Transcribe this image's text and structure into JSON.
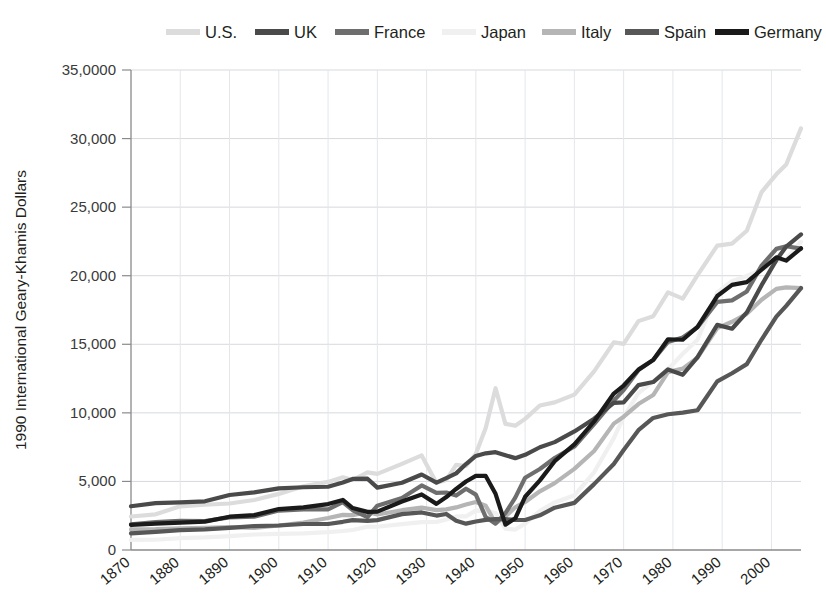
{
  "chart_data": {
    "type": "line",
    "title": "",
    "xlabel": "",
    "ylabel": "1990 International Geary-Khamis Dollars",
    "xlim": [
      1870,
      2006
    ],
    "ylim": [
      0,
      35000
    ],
    "grid": true,
    "legend_position": "top",
    "y_ticks": [
      {
        "value": 35000,
        "label": "35,0000"
      },
      {
        "value": 30000,
        "label": "30,000"
      },
      {
        "value": 25000,
        "label": "25,000"
      },
      {
        "value": 20000,
        "label": "20,000"
      },
      {
        "value": 15000,
        "label": "15,000"
      },
      {
        "value": 10000,
        "label": "10,000"
      },
      {
        "value": 5000,
        "label": "5,000"
      },
      {
        "value": 0,
        "label": "0"
      }
    ],
    "x_ticks": [
      {
        "value": 1870,
        "label": "1870"
      },
      {
        "value": 1880,
        "label": "1880"
      },
      {
        "value": 1890,
        "label": "1890"
      },
      {
        "value": 1900,
        "label": "1900"
      },
      {
        "value": 1910,
        "label": "1910"
      },
      {
        "value": 1920,
        "label": "1920"
      },
      {
        "value": 1930,
        "label": "1930"
      },
      {
        "value": 1940,
        "label": "1940"
      },
      {
        "value": 1950,
        "label": "1950"
      },
      {
        "value": 1960,
        "label": "1960"
      },
      {
        "value": 1970,
        "label": "1970"
      },
      {
        "value": 1980,
        "label": "1980"
      },
      {
        "value": 1990,
        "label": "1990"
      },
      {
        "value": 2000,
        "label": "2000"
      }
    ],
    "series": [
      {
        "name": "U.S.",
        "color": "#dcdcdc",
        "width": 4.2,
        "x": [
          1870,
          1875,
          1880,
          1885,
          1890,
          1895,
          1900,
          1905,
          1910,
          1913,
          1915,
          1918,
          1920,
          1925,
          1929,
          1930,
          1932,
          1934,
          1936,
          1938,
          1940,
          1942,
          1944,
          1946,
          1948,
          1950,
          1953,
          1956,
          1960,
          1964,
          1968,
          1970,
          1973,
          1976,
          1979,
          1982,
          1985,
          1989,
          1992,
          1995,
          1998,
          2001,
          2003,
          2006
        ],
        "values": [
          2445,
          2600,
          3184,
          3300,
          3392,
          3644,
          4091,
          4642,
          4964,
          5301,
          5100,
          5659,
          5552,
          6282,
          6899,
          6213,
          4908,
          5114,
          6204,
          6126,
          7010,
          8899,
          11799,
          9197,
          9065,
          9561,
          10540,
          10761,
          11328,
          13026,
          15140,
          15030,
          16689,
          17045,
          18789,
          18325,
          20039,
          22197,
          22345,
          23277,
          26096,
          27395,
          28113,
          30746
        ]
      },
      {
        "name": "UK",
        "color": "#4a4a4a",
        "width": 4.2,
        "x": [
          1870,
          1875,
          1880,
          1885,
          1890,
          1895,
          1900,
          1905,
          1910,
          1913,
          1915,
          1918,
          1920,
          1925,
          1929,
          1932,
          1934,
          1936,
          1938,
          1940,
          1942,
          1944,
          1946,
          1948,
          1950,
          1953,
          1956,
          1960,
          1964,
          1968,
          1970,
          1973,
          1976,
          1979,
          1982,
          1985,
          1989,
          1992,
          1995,
          1998,
          2001,
          2003,
          2006
        ],
        "values": [
          3190,
          3415,
          3477,
          3549,
          4009,
          4197,
          4492,
          4577,
          4611,
          4921,
          5184,
          5200,
          4548,
          4905,
          5503,
          4908,
          5247,
          5586,
          6266,
          6856,
          7048,
          7131,
          6907,
          6698,
          6939,
          7492,
          7867,
          8645,
          9578,
          10727,
          10767,
          12022,
          12247,
          13167,
          12777,
          14063,
          16414,
          16133,
          17321,
          19313,
          21137,
          22122,
          23013
        ]
      },
      {
        "name": "France",
        "color": "#6e6e6e",
        "width": 4.2,
        "x": [
          1870,
          1875,
          1880,
          1885,
          1890,
          1895,
          1900,
          1905,
          1910,
          1913,
          1915,
          1918,
          1920,
          1925,
          1929,
          1932,
          1934,
          1936,
          1938,
          1940,
          1942,
          1944,
          1946,
          1948,
          1950,
          1953,
          1956,
          1960,
          1964,
          1968,
          1970,
          1973,
          1976,
          1979,
          1982,
          1985,
          1989,
          1992,
          1995,
          1998,
          2001,
          2003,
          2006
        ],
        "values": [
          1876,
          2035,
          2120,
          2115,
          2376,
          2424,
          2876,
          2965,
          2965,
          3485,
          2900,
          2396,
          3227,
          3787,
          4710,
          4166,
          4192,
          3968,
          4466,
          4042,
          2400,
          1920,
          2686,
          3819,
          5271,
          5905,
          6709,
          7546,
          9173,
          10892,
          11664,
          13114,
          13864,
          15170,
          15500,
          16241,
          18093,
          18199,
          18855,
          20733,
          21959,
          22152,
          21980
        ]
      },
      {
        "name": "Japan",
        "color": "#f0f0f0",
        "width": 4.2,
        "x": [
          1870,
          1875,
          1880,
          1885,
          1890,
          1895,
          1900,
          1905,
          1910,
          1913,
          1915,
          1918,
          1920,
          1925,
          1929,
          1932,
          1934,
          1936,
          1938,
          1940,
          1942,
          1944,
          1946,
          1948,
          1950,
          1953,
          1956,
          1960,
          1964,
          1968,
          1970,
          1973,
          1976,
          1979,
          1982,
          1985,
          1989,
          1992,
          1995,
          1998,
          2001,
          2003,
          2006
        ],
        "values": [
          737,
          746,
          863,
          916,
          1012,
          1130,
          1180,
          1216,
          1304,
          1387,
          1460,
          1700,
          1696,
          1885,
          2026,
          2040,
          2219,
          2450,
          2449,
          2874,
          2850,
          2700,
          1555,
          1490,
          1921,
          2860,
          3470,
          3986,
          5668,
          8160,
          9714,
          11434,
          12304,
          13163,
          14309,
          15331,
          18789,
          19600,
          19979,
          20431,
          21039,
          21218,
          22462
        ]
      },
      {
        "name": "Italy",
        "color": "#b5b5b5",
        "width": 4.2,
        "x": [
          1870,
          1875,
          1880,
          1885,
          1890,
          1895,
          1900,
          1905,
          1910,
          1913,
          1915,
          1918,
          1920,
          1925,
          1929,
          1932,
          1934,
          1936,
          1938,
          1940,
          1942,
          1944,
          1946,
          1948,
          1950,
          1953,
          1956,
          1960,
          1964,
          1968,
          1970,
          1973,
          1976,
          1979,
          1982,
          1985,
          1989,
          1992,
          1995,
          1998,
          2001,
          2003,
          2006
        ],
        "values": [
          1499,
          1516,
          1581,
          1607,
          1667,
          1615,
          1785,
          2005,
          2332,
          2564,
          2537,
          2770,
          2587,
          2902,
          3093,
          2909,
          2960,
          3105,
          3316,
          3505,
          3230,
          1950,
          2449,
          3113,
          3502,
          4280,
          4873,
          5916,
          7218,
          9214,
          9719,
          10643,
          11300,
          12971,
          13226,
          14022,
          16181,
          16641,
          17219,
          18250,
          19040,
          19150,
          19100
        ]
      },
      {
        "name": "Spain",
        "color": "#575757",
        "width": 4.2,
        "x": [
          1870,
          1875,
          1880,
          1885,
          1890,
          1895,
          1900,
          1905,
          1910,
          1913,
          1915,
          1918,
          1920,
          1925,
          1929,
          1932,
          1934,
          1936,
          1938,
          1940,
          1942,
          1944,
          1946,
          1948,
          1950,
          1953,
          1956,
          1960,
          1964,
          1968,
          1970,
          1973,
          1976,
          1979,
          1982,
          1985,
          1989,
          1992,
          1995,
          1998,
          2001,
          2003,
          2006
        ],
        "values": [
          1207,
          1320,
          1443,
          1505,
          1610,
          1748,
          1786,
          1896,
          1895,
          2056,
          2180,
          2120,
          2177,
          2614,
          2739,
          2511,
          2627,
          2130,
          1920,
          2080,
          2192,
          2248,
          2249,
          2192,
          2189,
          2530,
          3085,
          3437,
          4803,
          6277,
          7291,
          8739,
          9628,
          9897,
          10021,
          10190,
          12292,
          12888,
          13554,
          15346,
          17020,
          17800,
          19100
        ]
      },
      {
        "name": "Germany",
        "color": "#1a1a1a",
        "width": 4.2,
        "x": [
          1870,
          1875,
          1880,
          1885,
          1890,
          1895,
          1900,
          1905,
          1910,
          1913,
          1915,
          1918,
          1920,
          1925,
          1929,
          1932,
          1934,
          1936,
          1938,
          1940,
          1942,
          1944,
          1946,
          1948,
          1950,
          1953,
          1956,
          1960,
          1964,
          1968,
          1970,
          1973,
          1976,
          1979,
          1982,
          1985,
          1989,
          1992,
          1995,
          1998,
          2001,
          2003,
          2006
        ],
        "values": [
          1839,
          1920,
          1991,
          2065,
          2428,
          2545,
          2985,
          3104,
          3348,
          3648,
          3060,
          2780,
          2796,
          3532,
          4051,
          3362,
          3858,
          4451,
          4994,
          5403,
          5403,
          4100,
          1850,
          2310,
          3881,
          5079,
          6477,
          7705,
          9370,
          11410,
          11993,
          13152,
          13849,
          15369,
          15332,
          16263,
          18517,
          19331,
          19534,
          20434,
          21343,
          21100,
          22000
        ]
      }
    ]
  },
  "legend": {
    "items": [
      {
        "label": "U.S."
      },
      {
        "label": "UK"
      },
      {
        "label": "France"
      },
      {
        "label": "Japan"
      },
      {
        "label": "Italy"
      },
      {
        "label": "Spain"
      },
      {
        "label": "Germany"
      }
    ]
  }
}
